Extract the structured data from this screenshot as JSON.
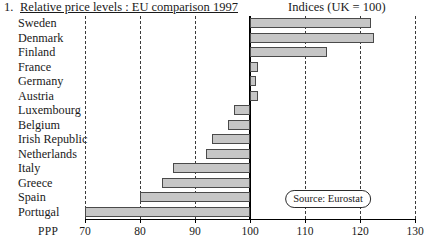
{
  "header": {
    "number": "1.",
    "title": "Relative price levels : EU comparison 1997",
    "indices_note": "Indices (UK = 100)"
  },
  "axis": {
    "unit_label": "PPP",
    "ticks": [
      "70",
      "80",
      "90",
      "100",
      "110",
      "120",
      "130"
    ]
  },
  "annotation": {
    "source": "Source: Eurostat"
  },
  "chart_data": {
    "type": "bar",
    "orientation": "horizontal",
    "title": "Relative price levels : EU comparison 1997",
    "subtitle": "Indices (UK = 100)",
    "xlabel": "PPP",
    "ylabel": "",
    "xlim": [
      70,
      130
    ],
    "baseline": 100,
    "grid": true,
    "gridlines": [
      70,
      80,
      90,
      110,
      120,
      130
    ],
    "xticks": [
      70,
      80,
      90,
      100,
      110,
      120,
      130
    ],
    "legend": false,
    "annotations": [
      "Source: Eurostat"
    ],
    "bar_color": "#c6c6c6",
    "bar_edge_color": "#4a4a4a",
    "categories": [
      "Sweden",
      "Denmark",
      "Finland",
      "France",
      "Germany",
      "Austria",
      "Luxembourg",
      "Belgium",
      "Irish Republic",
      "Netherlands",
      "Italy",
      "Greece",
      "Spain",
      "Portugal"
    ],
    "values": [
      122,
      122.5,
      114,
      101.5,
      101,
      101.5,
      100,
      100,
      100,
      100,
      100,
      100,
      100,
      100
    ],
    "bar_start": [
      100,
      100,
      100,
      100,
      100,
      100,
      97,
      96,
      93,
      92,
      86,
      84,
      80,
      70
    ],
    "bar_end": [
      122,
      122.5,
      114,
      101.5,
      101,
      101.5,
      100,
      100,
      100,
      100,
      100,
      100,
      100,
      100
    ]
  }
}
